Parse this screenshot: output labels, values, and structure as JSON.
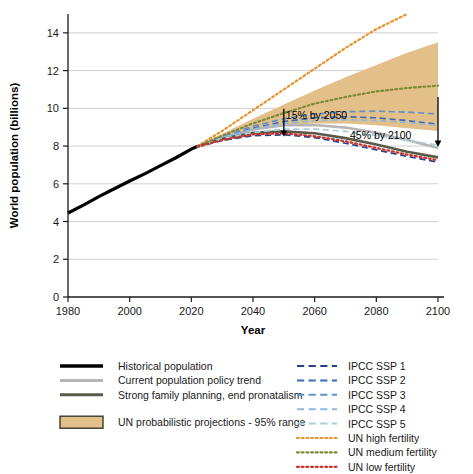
{
  "chart_data": {
    "type": "line",
    "title": "",
    "xlabel": "Year",
    "ylabel": "World population (billions)",
    "xlim": [
      1980,
      2100
    ],
    "ylim": [
      0,
      15
    ],
    "xticks": [
      1980,
      2000,
      2020,
      2040,
      2060,
      2080,
      2100
    ],
    "yticks": [
      0,
      2,
      4,
      6,
      8,
      10,
      12,
      14
    ],
    "grid": true,
    "legend_position": "below",
    "annotations": [
      {
        "text": "15% by 2050",
        "x": 2050,
        "y": 9.45
      },
      {
        "text": "45% by 2100",
        "x": 2092,
        "y": 8.35
      }
    ],
    "band": {
      "name": "UN probabilistic projections - 95% range",
      "color": "#e3c08a",
      "x": [
        2022,
        2030,
        2040,
        2050,
        2060,
        2070,
        2080,
        2090,
        2100
      ],
      "upper": [
        8.02,
        8.65,
        9.45,
        10.2,
        10.95,
        11.65,
        12.3,
        12.95,
        13.5
      ],
      "lower": [
        7.98,
        8.4,
        8.85,
        9.1,
        9.2,
        9.2,
        9.1,
        8.95,
        8.8
      ]
    },
    "series": [
      {
        "name": "Historical population",
        "color": "#000000",
        "style": "solid",
        "width": 3.2,
        "x": [
          1980,
          1985,
          1990,
          1995,
          2000,
          2005,
          2010,
          2015,
          2020,
          2022
        ],
        "values": [
          4.45,
          4.87,
          5.32,
          5.74,
          6.15,
          6.54,
          6.96,
          7.38,
          7.84,
          7.99
        ]
      },
      {
        "name": "Current population policy trend",
        "color": "#b5b5b5",
        "style": "solid",
        "width": 2.6,
        "x": [
          2022,
          2030,
          2040,
          2050,
          2060,
          2070,
          2080,
          2090,
          2100
        ],
        "values": [
          7.99,
          8.45,
          8.88,
          9.1,
          9.12,
          8.98,
          8.7,
          8.32,
          7.9
        ]
      },
      {
        "name": "Strong family planning, end pronatalism",
        "color": "#5a5a4a",
        "style": "solid",
        "width": 2.6,
        "x": [
          2022,
          2030,
          2040,
          2050,
          2060,
          2070,
          2080,
          2090,
          2100
        ],
        "values": [
          7.99,
          8.38,
          8.7,
          8.78,
          8.68,
          8.42,
          8.08,
          7.7,
          7.4
        ]
      },
      {
        "name": "IPCC SSP 1",
        "color": "#2b3f8c",
        "style": "dashed",
        "width": 1.7,
        "x": [
          2022,
          2030,
          2040,
          2050,
          2060,
          2070,
          2080,
          2090,
          2100
        ],
        "values": [
          7.95,
          8.3,
          8.55,
          8.6,
          8.45,
          8.15,
          7.8,
          7.45,
          7.15
        ]
      },
      {
        "name": "IPCC SSP 2",
        "color": "#3d6bb5",
        "style": "dashed",
        "width": 1.7,
        "x": [
          2022,
          2030,
          2040,
          2050,
          2060,
          2070,
          2080,
          2090,
          2100
        ],
        "values": [
          7.98,
          8.45,
          8.95,
          9.3,
          9.5,
          9.55,
          9.5,
          9.35,
          9.15
        ]
      },
      {
        "name": "IPCC SSP 3",
        "color": "#5e92cc",
        "style": "dashed",
        "width": 1.7,
        "x": [
          2022,
          2030,
          2040,
          2050,
          2060,
          2070,
          2080,
          2090,
          2100
        ],
        "values": [
          8.0,
          8.5,
          9.05,
          9.45,
          9.7,
          9.82,
          9.85,
          9.8,
          9.7
        ]
      },
      {
        "name": "IPCC SSP 4",
        "color": "#8fb8dd",
        "style": "dashed",
        "width": 1.7,
        "x": [
          2022,
          2030,
          2040,
          2050,
          2060,
          2070,
          2080,
          2090,
          2100
        ],
        "values": [
          7.99,
          8.45,
          8.9,
          9.2,
          9.35,
          9.4,
          9.35,
          9.25,
          9.1
        ]
      },
      {
        "name": "IPCC SSP 5",
        "color": "#a9cfdc",
        "style": "dashed",
        "width": 1.7,
        "x": [
          2022,
          2030,
          2040,
          2050,
          2060,
          2070,
          2080,
          2090,
          2100
        ],
        "values": [
          7.96,
          8.38,
          8.72,
          8.9,
          8.9,
          8.78,
          8.55,
          8.3,
          8.05
        ]
      },
      {
        "name": "UN high fertility",
        "color": "#e8922e",
        "style": "dotted",
        "width": 2.2,
        "x": [
          2022,
          2030,
          2040,
          2050,
          2060,
          2070,
          2080,
          2090
        ],
        "values": [
          8.0,
          8.8,
          9.9,
          11.0,
          12.1,
          13.2,
          14.2,
          15.0
        ]
      },
      {
        "name": "UN medium fertility",
        "color": "#7d8a37",
        "style": "dotted",
        "width": 2.2,
        "x": [
          2022,
          2030,
          2040,
          2050,
          2060,
          2070,
          2080,
          2090,
          2100
        ],
        "values": [
          7.99,
          8.55,
          9.2,
          9.75,
          10.25,
          10.6,
          10.9,
          11.08,
          11.2
        ]
      },
      {
        "name": "UN low fertility",
        "color": "#c8322a",
        "style": "dotted",
        "width": 2.2,
        "x": [
          2022,
          2030,
          2040,
          2050,
          2060,
          2070,
          2080,
          2090,
          2100
        ],
        "values": [
          7.97,
          8.32,
          8.62,
          8.68,
          8.52,
          8.25,
          7.9,
          7.55,
          7.25
        ]
      }
    ]
  },
  "legend": {
    "left_column": [
      {
        "label": "Historical population",
        "color": "#000000",
        "style": "solid",
        "width": 3.4
      },
      {
        "label": "Current population policy trend",
        "color": "#b5b5b5",
        "style": "solid",
        "width": 3.0
      },
      {
        "label": "Strong family planning, end pronatalism",
        "color": "#5a5a4a",
        "style": "solid",
        "width": 3.0
      }
    ],
    "band_entry": {
      "label": "UN probabilistic projections - 95% range",
      "color": "#e3c08a",
      "border": "#3a3a2a"
    },
    "right_column": [
      {
        "label": "IPCC SSP 1",
        "color": "#2b3f8c",
        "style": "dashed"
      },
      {
        "label": "IPCC SSP 2",
        "color": "#3d6bb5",
        "style": "dashed"
      },
      {
        "label": "IPCC SSP 3",
        "color": "#5e92cc",
        "style": "dashed"
      },
      {
        "label": "IPCC SSP 4",
        "color": "#8fb8dd",
        "style": "dashed"
      },
      {
        "label": "IPCC SSP 5",
        "color": "#a9cfdc",
        "style": "dashed"
      },
      {
        "label": "UN high fertility",
        "color": "#e8922e",
        "style": "dotted"
      },
      {
        "label": "UN medium fertility",
        "color": "#7d8a37",
        "style": "dotted"
      },
      {
        "label": "UN low fertility",
        "color": "#c8322a",
        "style": "dotted"
      }
    ]
  }
}
